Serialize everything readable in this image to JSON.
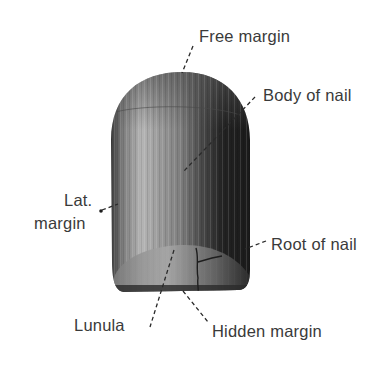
{
  "diagram": {
    "labels": {
      "free_margin": "Free margin",
      "body_of_nail": "Body of nail",
      "lat_margin_line1": "Lat.",
      "lat_margin_line2": "margin",
      "root_of_nail": "Root of nail",
      "lunula": "Lunula",
      "hidden_margin": "Hidden margin"
    },
    "colors": {
      "text": "#3a3a3a",
      "leader": "#2a2a2a",
      "nail_dark": "#1e1e1e",
      "nail_mid": "#6e6e6e",
      "nail_light": "#b8b8b8",
      "lunula": "#9a9a9a"
    }
  }
}
